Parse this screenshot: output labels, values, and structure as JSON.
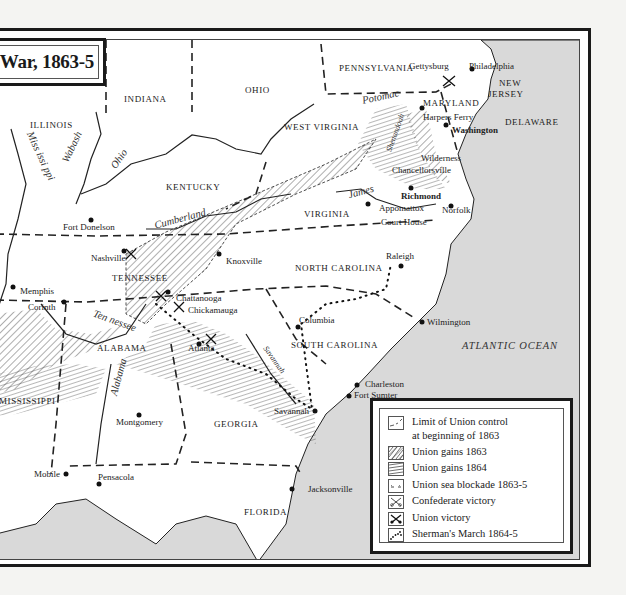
{
  "title": "War, 1863-5",
  "colors": {
    "sea": "#d9d9d9",
    "land": "#ffffff",
    "ink": "#1a1a1a",
    "page": "#f4f4f2"
  },
  "states": [
    {
      "name": "ILLINOIS",
      "x": 34,
      "y": 117
    },
    {
      "name": "INDIANA",
      "x": 128,
      "y": 91
    },
    {
      "name": "OHIO",
      "x": 249,
      "y": 82
    },
    {
      "name": "PENNSYLVANIA",
      "x": 343,
      "y": 60
    },
    {
      "name": "NEW",
      "x": 503,
      "y": 75
    },
    {
      "name": "JERSEY",
      "x": 492,
      "y": 86
    },
    {
      "name": "MARYLAND",
      "x": 427,
      "y": 95
    },
    {
      "name": "DELAWARE",
      "x": 509,
      "y": 114
    },
    {
      "name": "WEST VIRGINIA",
      "x": 288,
      "y": 119
    },
    {
      "name": "KENTUCKY",
      "x": 170,
      "y": 179
    },
    {
      "name": "VIRGINIA",
      "x": 308,
      "y": 206
    },
    {
      "name": "TENNESSEE",
      "x": 116,
      "y": 270
    },
    {
      "name": "NORTH CAROLINA",
      "x": 299,
      "y": 260
    },
    {
      "name": "SOUTH CAROLINA",
      "x": 295,
      "y": 337
    },
    {
      "name": "ALABAMA",
      "x": 101,
      "y": 340
    },
    {
      "name": "MISSISSIPPI",
      "x": 3,
      "y": 393
    },
    {
      "name": "GEORGIA",
      "x": 218,
      "y": 416
    },
    {
      "name": "FLORIDA",
      "x": 248,
      "y": 504
    }
  ],
  "cities": [
    {
      "name": "Gettysburg",
      "x": 413,
      "y": 62,
      "bold": false
    },
    {
      "name": "Philadelphia",
      "x": 473,
      "y": 62,
      "bold": false
    },
    {
      "name": "Harpers Ferry",
      "x": 427,
      "y": 109,
      "bold": false
    },
    {
      "name": "Washington",
      "x": 456,
      "y": 122,
      "bold": true
    },
    {
      "name": "Wilderness",
      "x": 425,
      "y": 150,
      "bold": false
    },
    {
      "name": "Chancellorsville",
      "x": 396,
      "y": 162,
      "bold": false
    },
    {
      "name": "Richmond",
      "x": 405,
      "y": 188,
      "bold": true
    },
    {
      "name": "Appomattox",
      "x": 383,
      "y": 200,
      "bold": false
    },
    {
      "name": "Court House",
      "x": 385,
      "y": 214,
      "bold": false
    },
    {
      "name": "Norfolk",
      "x": 446,
      "y": 202,
      "bold": false
    },
    {
      "name": "Fort Donelson",
      "x": 67,
      "y": 219,
      "bold": false
    },
    {
      "name": "Nashville",
      "x": 95,
      "y": 250,
      "bold": false
    },
    {
      "name": "Knoxville",
      "x": 230,
      "y": 253,
      "bold": false
    },
    {
      "name": "Raleigh",
      "x": 390,
      "y": 248,
      "bold": false
    },
    {
      "name": "Memphis",
      "x": 24,
      "y": 283,
      "bold": false
    },
    {
      "name": "Corinth",
      "x": 32,
      "y": 299,
      "bold": false
    },
    {
      "name": "Chattanooga",
      "x": 180,
      "y": 290,
      "bold": false
    },
    {
      "name": "Chickamauga",
      "x": 192,
      "y": 302,
      "bold": false
    },
    {
      "name": "Columbia",
      "x": 303,
      "y": 312,
      "bold": false
    },
    {
      "name": "Wilmington",
      "x": 431,
      "y": 314,
      "bold": false
    },
    {
      "name": "Atlanta",
      "x": 192,
      "y": 340,
      "bold": false
    },
    {
      "name": "Charleston",
      "x": 369,
      "y": 376,
      "bold": false
    },
    {
      "name": "Fort Sumter",
      "x": 358,
      "y": 387,
      "bold": false
    },
    {
      "name": "Savannah",
      "x": 278,
      "y": 403,
      "bold": false
    },
    {
      "name": "Montgomery",
      "x": 120,
      "y": 414,
      "bold": false
    },
    {
      "name": "Mobile",
      "x": 38,
      "y": 466,
      "bold": false
    },
    {
      "name": "Pensacola",
      "x": 102,
      "y": 469,
      "bold": false
    },
    {
      "name": "Jacksonville",
      "x": 312,
      "y": 481,
      "bold": false
    }
  ],
  "rivers": [
    {
      "name": "Wabash",
      "x": 60,
      "y": 138,
      "rot": -65
    },
    {
      "name": "Miss issi ppi",
      "x": 18,
      "y": 147,
      "rot": 65
    },
    {
      "name": "Ohio",
      "x": 113,
      "y": 150,
      "rot": -55
    },
    {
      "name": "Potomac",
      "x": 368,
      "y": 88,
      "rot": -12
    },
    {
      "name": "Shenandoah",
      "x": 392,
      "y": 125,
      "rot": -70
    },
    {
      "name": "Cumberland",
      "x": 158,
      "y": 210,
      "rot": -15
    },
    {
      "name": "James",
      "x": 352,
      "y": 183,
      "rot": -15
    },
    {
      "name": "Ten nessee",
      "x": 96,
      "y": 312,
      "rot": 20
    },
    {
      "name": "Alabama",
      "x": 112,
      "y": 368,
      "rot": -75
    },
    {
      "name": "Savannah",
      "x": 265,
      "y": 352,
      "rot": 55
    }
  ],
  "ocean": {
    "name": "ATLANTIC OCEAN",
    "x": 466,
    "y": 337
  },
  "legend": {
    "items": [
      {
        "icon": "limit-union-control-icon",
        "label": "Limit of Union control",
        "label2": "at beginning of 1863"
      },
      {
        "icon": "union-gains-1863-icon",
        "label": "Union gains 1863"
      },
      {
        "icon": "union-gains-1864-icon",
        "label": "Union gains 1864"
      },
      {
        "icon": "sea-blockade-icon",
        "label": "Union sea blockade 1863-5"
      },
      {
        "icon": "confederate-victory-icon",
        "label": "Confederate victory"
      },
      {
        "icon": "union-victory-icon",
        "label": "Union victory"
      },
      {
        "icon": "shermans-march-icon",
        "label": "Sherman's March 1864-5"
      }
    ]
  }
}
